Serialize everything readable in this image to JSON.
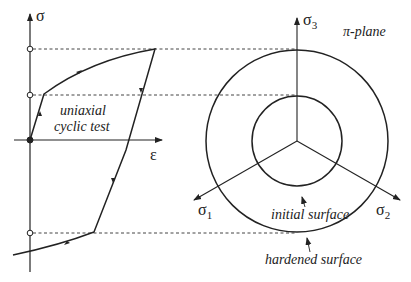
{
  "left_panel": {
    "y_axis_label": "σ",
    "x_axis_label": "ε",
    "caption_line1": "uniaxial",
    "caption_line2": "cyclic test"
  },
  "right_panel": {
    "plane_label": "π-plane",
    "axis1_label": "σ",
    "axis1_sub": "1",
    "axis2_label": "σ",
    "axis2_sub": "2",
    "axis3_label": "σ",
    "axis3_sub": "3",
    "inner_label": "initial surface",
    "outer_label": "hardened surface"
  },
  "colors": {
    "ink": "#222222",
    "background": "#ffffff"
  }
}
